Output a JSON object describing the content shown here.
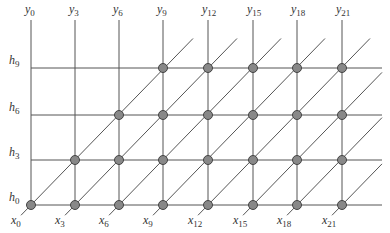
{
  "diagram": {
    "colors": {
      "line": "#555555",
      "node_fill": "#888888",
      "node_stroke": "#444444",
      "text": "#333333"
    },
    "columns": [
      {
        "top": "y",
        "top_sub": "0",
        "bottom": "x",
        "bottom_sub": "0",
        "x": 31
      },
      {
        "top": "y",
        "top_sub": "3",
        "bottom": "x",
        "bottom_sub": "3",
        "x": 75
      },
      {
        "top": "y",
        "top_sub": "6",
        "bottom": "x",
        "bottom_sub": "6",
        "x": 119
      },
      {
        "top": "y",
        "top_sub": "9",
        "bottom": "x",
        "bottom_sub": "9",
        "x": 163
      },
      {
        "top": "y",
        "top_sub": "12",
        "bottom": "x",
        "bottom_sub": "12",
        "x": 208
      },
      {
        "top": "y",
        "top_sub": "15",
        "bottom": "x",
        "bottom_sub": "15",
        "x": 253
      },
      {
        "top": "y",
        "top_sub": "18",
        "bottom": "x",
        "bottom_sub": "18",
        "x": 297
      },
      {
        "top": "y",
        "top_sub": "21",
        "bottom": "x",
        "bottom_sub": "21",
        "x": 342
      }
    ],
    "rows": [
      {
        "label": "h",
        "sub": "9",
        "y": 68
      },
      {
        "label": "h",
        "sub": "6",
        "y": 115
      },
      {
        "label": "h",
        "sub": "3",
        "y": 160
      },
      {
        "label": "h",
        "sub": "0",
        "y": 205
      }
    ]
  }
}
